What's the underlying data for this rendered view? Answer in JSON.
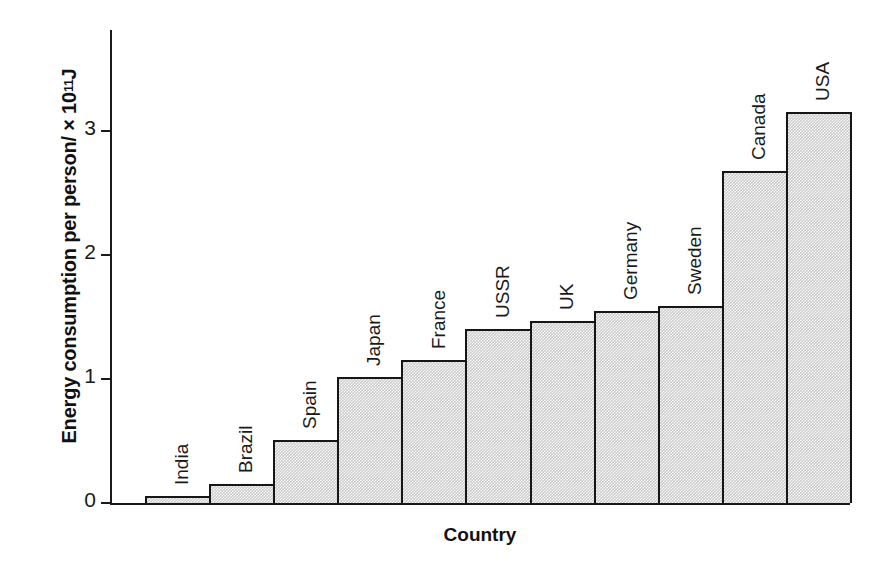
{
  "chart_data": {
    "type": "bar",
    "title": "",
    "xlabel": "Country",
    "ylabel": "Energy consumption per person/ × 10¹¹ J",
    "ylabel_prefix": "Energy consumption per person/ × 10",
    "ylabel_exponent": "11",
    "ylabel_suffix": " J",
    "categories": [
      "India",
      "Brazil",
      "Spain",
      "Japan",
      "France",
      "USSR",
      "UK",
      "Germany",
      "Sweden",
      "Canada",
      "USA"
    ],
    "values": [
      0.06,
      0.15,
      0.51,
      1.02,
      1.15,
      1.4,
      1.47,
      1.55,
      1.59,
      2.68,
      3.15
    ],
    "ylim": [
      0,
      3.6
    ],
    "yticks": [
      0,
      1,
      2,
      3
    ],
    "ytick_labels": [
      "0",
      "1",
      "2",
      "3"
    ],
    "grid": false,
    "legend": null,
    "bar_fill": "#c9c9c9",
    "bar_edge": "#161616",
    "axis_color": "#1a1a1a",
    "background": "#ffffff"
  }
}
